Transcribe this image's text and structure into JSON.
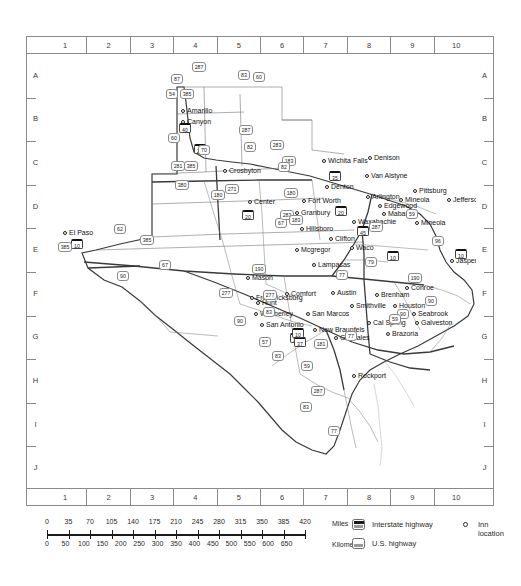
{
  "map": {
    "title": "Texas highway and inn location map",
    "grid": {
      "columns": [
        "1",
        "2",
        "3",
        "4",
        "5",
        "6",
        "7",
        "8",
        "9",
        "10"
      ],
      "rows": [
        "A",
        "B",
        "C",
        "D",
        "E",
        "F",
        "G",
        "H",
        "I",
        "J"
      ]
    },
    "cities": [
      {
        "name": "Amarillo",
        "x": 186,
        "y": 110,
        "anchor": "left"
      },
      {
        "name": "Canyon",
        "x": 186,
        "y": 121,
        "anchor": "left"
      },
      {
        "name": "Crosbyton",
        "x": 228,
        "y": 170,
        "anchor": "left"
      },
      {
        "name": "Wichita Falls",
        "x": 327,
        "y": 160,
        "anchor": "left"
      },
      {
        "name": "Denison",
        "x": 373,
        "y": 157,
        "anchor": "left"
      },
      {
        "name": "Van Alstyne",
        "x": 370,
        "y": 175,
        "anchor": "left"
      },
      {
        "name": "Denton",
        "x": 330,
        "y": 186,
        "anchor": "left"
      },
      {
        "name": "Pittsburg",
        "x": 418,
        "y": 190,
        "anchor": "left"
      },
      {
        "name": "Jefferson",
        "x": 452,
        "y": 199,
        "anchor": "left"
      },
      {
        "name": "Mineola",
        "x": 404,
        "y": 199,
        "anchor": "left"
      },
      {
        "name": "Arlington",
        "x": 371,
        "y": 196,
        "anchor": "left"
      },
      {
        "name": "Edgewood",
        "x": 383,
        "y": 205,
        "anchor": "left"
      },
      {
        "name": "Fort Worth",
        "x": 307,
        "y": 200,
        "anchor": "left"
      },
      {
        "name": "Center",
        "x": 253,
        "y": 201,
        "anchor": "left"
      },
      {
        "name": "Granbury",
        "x": 300,
        "y": 212,
        "anchor": "left"
      },
      {
        "name": "Mabank",
        "x": 387,
        "y": 213,
        "anchor": "left"
      },
      {
        "name": "Mineola",
        "x": 420,
        "y": 222,
        "anchor": "left"
      },
      {
        "name": "Waxahachie",
        "x": 357,
        "y": 221,
        "anchor": "left"
      },
      {
        "name": "Hillsboro",
        "x": 305,
        "y": 228,
        "anchor": "left"
      },
      {
        "name": "Clifton",
        "x": 334,
        "y": 238,
        "anchor": "left"
      },
      {
        "name": "El Paso",
        "x": 68,
        "y": 232,
        "anchor": "left"
      },
      {
        "name": "Waco",
        "x": 355,
        "y": 247,
        "anchor": "left"
      },
      {
        "name": "Mcgregor",
        "x": 300,
        "y": 249,
        "anchor": "left"
      },
      {
        "name": "Jasper",
        "x": 455,
        "y": 260,
        "anchor": "left"
      },
      {
        "name": "Lampasas",
        "x": 317,
        "y": 264,
        "anchor": "left"
      },
      {
        "name": "Mason",
        "x": 251,
        "y": 277,
        "anchor": "left"
      },
      {
        "name": "Conroe",
        "x": 410,
        "y": 287,
        "anchor": "left"
      },
      {
        "name": "Austin",
        "x": 336,
        "y": 292,
        "anchor": "left"
      },
      {
        "name": "Comfort",
        "x": 290,
        "y": 293,
        "anchor": "left"
      },
      {
        "name": "Brenham",
        "x": 380,
        "y": 294,
        "anchor": "left"
      },
      {
        "name": "Fredericksburg",
        "x": 255,
        "y": 297,
        "anchor": "left"
      },
      {
        "name": "Hunt",
        "x": 261,
        "y": 302,
        "anchor": "left"
      },
      {
        "name": "Smithville",
        "x": 355,
        "y": 305,
        "anchor": "left"
      },
      {
        "name": "Houston",
        "x": 398,
        "y": 305,
        "anchor": "left"
      },
      {
        "name": "Seabrook",
        "x": 417,
        "y": 313,
        "anchor": "left"
      },
      {
        "name": "Wimberley",
        "x": 259,
        "y": 313,
        "anchor": "left"
      },
      {
        "name": "San Marcos",
        "x": 311,
        "y": 313,
        "anchor": "left"
      },
      {
        "name": "Cal Spring",
        "x": 372,
        "y": 322,
        "anchor": "left"
      },
      {
        "name": "Galveston",
        "x": 420,
        "y": 322,
        "anchor": "left"
      },
      {
        "name": "San Antonio",
        "x": 265,
        "y": 324,
        "anchor": "left"
      },
      {
        "name": "New Braunfels",
        "x": 318,
        "y": 329,
        "anchor": "left"
      },
      {
        "name": "Gonzales",
        "x": 339,
        "y": 337,
        "anchor": "left"
      },
      {
        "name": "Brazoria",
        "x": 391,
        "y": 333,
        "anchor": "left"
      },
      {
        "name": "Rockport",
        "x": 357,
        "y": 375,
        "anchor": "left"
      }
    ],
    "interstate_shields": [
      {
        "label": "40",
        "x": 184,
        "y": 127
      },
      {
        "label": "27",
        "x": 199,
        "y": 148
      },
      {
        "label": "20",
        "x": 247,
        "y": 214
      },
      {
        "label": "10",
        "x": 76,
        "y": 243
      },
      {
        "label": "20",
        "x": 340,
        "y": 210
      },
      {
        "label": "10",
        "x": 392,
        "y": 255
      },
      {
        "label": "35",
        "x": 334,
        "y": 175
      },
      {
        "label": "45",
        "x": 362,
        "y": 230
      },
      {
        "label": "10",
        "x": 460,
        "y": 253
      },
      {
        "label": "35",
        "x": 295,
        "y": 337
      },
      {
        "label": "37",
        "x": 299,
        "y": 341
      },
      {
        "label": "10",
        "x": 297,
        "y": 332
      }
    ],
    "us_shields": [
      {
        "label": "287",
        "x": 198,
        "y": 66
      },
      {
        "label": "87",
        "x": 176,
        "y": 78
      },
      {
        "label": "83",
        "x": 243,
        "y": 74
      },
      {
        "label": "60",
        "x": 258,
        "y": 76
      },
      {
        "label": "54",
        "x": 171,
        "y": 93
      },
      {
        "label": "385",
        "x": 186,
        "y": 93
      },
      {
        "label": "60",
        "x": 173,
        "y": 137
      },
      {
        "label": "287",
        "x": 245,
        "y": 129
      },
      {
        "label": "70",
        "x": 203,
        "y": 149
      },
      {
        "label": "82",
        "x": 249,
        "y": 146
      },
      {
        "label": "283",
        "x": 276,
        "y": 144
      },
      {
        "label": "385",
        "x": 190,
        "y": 165
      },
      {
        "label": "183",
        "x": 288,
        "y": 160
      },
      {
        "label": "82",
        "x": 283,
        "y": 166
      },
      {
        "label": "380",
        "x": 181,
        "y": 184
      },
      {
        "label": "271",
        "x": 231,
        "y": 188
      },
      {
        "label": "180",
        "x": 217,
        "y": 194
      },
      {
        "label": "180",
        "x": 290,
        "y": 192
      },
      {
        "label": "67",
        "x": 280,
        "y": 222
      },
      {
        "label": "283",
        "x": 286,
        "y": 214
      },
      {
        "label": "183",
        "x": 295,
        "y": 219
      },
      {
        "label": "62",
        "x": 119,
        "y": 228
      },
      {
        "label": "385",
        "x": 146,
        "y": 239
      },
      {
        "label": "385",
        "x": 64,
        "y": 246
      },
      {
        "label": "90",
        "x": 122,
        "y": 275
      },
      {
        "label": "67",
        "x": 164,
        "y": 264
      },
      {
        "label": "90",
        "x": 482,
        "y": 257
      },
      {
        "label": "96",
        "x": 437,
        "y": 240
      },
      {
        "label": "59",
        "x": 411,
        "y": 213
      },
      {
        "label": "287",
        "x": 375,
        "y": 226
      },
      {
        "label": "79",
        "x": 370,
        "y": 261
      },
      {
        "label": "77",
        "x": 341,
        "y": 274
      },
      {
        "label": "190",
        "x": 258,
        "y": 268
      },
      {
        "label": "277",
        "x": 269,
        "y": 294
      },
      {
        "label": "277",
        "x": 225,
        "y": 292
      },
      {
        "label": "83",
        "x": 268,
        "y": 311
      },
      {
        "label": "90",
        "x": 239,
        "y": 320
      },
      {
        "label": "57",
        "x": 264,
        "y": 341
      },
      {
        "label": "181",
        "x": 320,
        "y": 343
      },
      {
        "label": "59",
        "x": 306,
        "y": 365
      },
      {
        "label": "77",
        "x": 350,
        "y": 335
      },
      {
        "label": "90",
        "x": 402,
        "y": 313
      },
      {
        "label": "59",
        "x": 394,
        "y": 318
      },
      {
        "label": "190",
        "x": 414,
        "y": 277
      },
      {
        "label": "90",
        "x": 430,
        "y": 300
      },
      {
        "label": "287",
        "x": 317,
        "y": 390
      },
      {
        "label": "83",
        "x": 305,
        "y": 406
      },
      {
        "label": "77",
        "x": 333,
        "y": 430
      },
      {
        "label": "83",
        "x": 277,
        "y": 355
      },
      {
        "label": "281",
        "x": 177,
        "y": 165
      }
    ]
  },
  "scale": {
    "miles": {
      "unit": "Miles",
      "ticks": [
        "0",
        "35",
        "70",
        "105",
        "140",
        "175",
        "210",
        "245",
        "280",
        "315",
        "350",
        "385",
        "420"
      ]
    },
    "kilometers": {
      "unit": "Kilometers",
      "ticks": [
        "0",
        "50",
        "100",
        "150",
        "200",
        "250",
        "300",
        "350",
        "400",
        "450",
        "500",
        "550",
        "600",
        "650"
      ]
    }
  },
  "legend": {
    "items": [
      {
        "icon": "interstate-shield-icon",
        "label": "Interstate highway"
      },
      {
        "icon": "us-highway-shield-icon",
        "label": "U.S. highway"
      },
      {
        "icon": "inn-location-circle-icon",
        "label": "Inn location"
      }
    ]
  }
}
